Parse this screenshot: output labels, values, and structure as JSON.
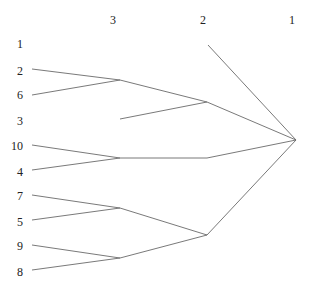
{
  "level_headers": [
    {
      "label": "3",
      "x": 113,
      "y": 20
    },
    {
      "label": "2",
      "x": 203,
      "y": 20
    },
    {
      "label": "1",
      "x": 292,
      "y": 20
    }
  ],
  "leaves": [
    {
      "label": "1",
      "x": 20,
      "y": 44
    },
    {
      "label": "2",
      "x": 20,
      "y": 71
    },
    {
      "label": "6",
      "x": 20,
      "y": 95
    },
    {
      "label": "3",
      "x": 20,
      "y": 121
    },
    {
      "label": "10",
      "x": 17,
      "y": 146
    },
    {
      "label": "4",
      "x": 20,
      "y": 172
    },
    {
      "label": "7",
      "x": 20,
      "y": 196
    },
    {
      "label": "5",
      "x": 20,
      "y": 222
    },
    {
      "label": "9",
      "x": 20,
      "y": 246
    },
    {
      "label": "8",
      "x": 20,
      "y": 272
    }
  ],
  "edges": [
    {
      "from": [
        32,
        69
      ],
      "to": [
        120,
        80
      ]
    },
    {
      "from": [
        32,
        95
      ],
      "to": [
        120,
        80
      ]
    },
    {
      "from": [
        120,
        80
      ],
      "to": [
        207,
        102
      ]
    },
    {
      "from": [
        120,
        119
      ],
      "to": [
        207,
        102
      ]
    },
    {
      "from": [
        207,
        102
      ],
      "to": [
        296,
        140
      ]
    },
    {
      "from": [
        208,
        45
      ],
      "to": [
        296,
        140
      ]
    },
    {
      "from": [
        32,
        145
      ],
      "to": [
        120,
        158
      ]
    },
    {
      "from": [
        32,
        170
      ],
      "to": [
        120,
        158
      ]
    },
    {
      "from": [
        120,
        158
      ],
      "to": [
        207,
        158
      ]
    },
    {
      "from": [
        207,
        158
      ],
      "to": [
        296,
        140
      ]
    },
    {
      "from": [
        32,
        195
      ],
      "to": [
        120,
        208
      ]
    },
    {
      "from": [
        32,
        220
      ],
      "to": [
        120,
        208
      ]
    },
    {
      "from": [
        120,
        208
      ],
      "to": [
        207,
        235
      ]
    },
    {
      "from": [
        32,
        245
      ],
      "to": [
        120,
        258
      ]
    },
    {
      "from": [
        32,
        270
      ],
      "to": [
        120,
        258
      ]
    },
    {
      "from": [
        120,
        258
      ],
      "to": [
        207,
        235
      ]
    },
    {
      "from": [
        207,
        235
      ],
      "to": [
        296,
        140
      ]
    }
  ],
  "style": {
    "line_color": "#6a6a6a",
    "text_color": "#222222"
  }
}
